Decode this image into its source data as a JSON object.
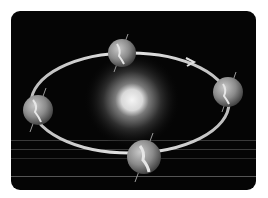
{
  "diagram": {
    "title": "Earth's orbit around the Sun",
    "background_color": "#050505",
    "orbit_color": "#d8d8d8",
    "sun": {
      "name": "Sun",
      "color": "#f2f2f2"
    },
    "earth_positions": [
      {
        "name": "Earth position top",
        "position": "top"
      },
      {
        "name": "Earth position right",
        "position": "right"
      },
      {
        "name": "Earth position bottom",
        "position": "bottom"
      },
      {
        "name": "Earth position left",
        "position": "left"
      }
    ],
    "direction_arrow": "counterclockwise-arrow"
  }
}
